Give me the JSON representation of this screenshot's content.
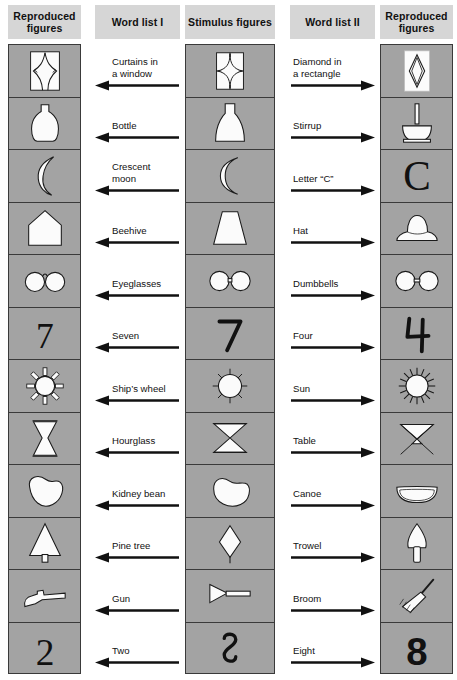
{
  "figure": {
    "columns": [
      {
        "id": "reproduced-left",
        "header": "Reproduced\nfigures",
        "kind": "figures"
      },
      {
        "id": "word-list-1",
        "header": "Word list I",
        "kind": "words",
        "arrow": "left"
      },
      {
        "id": "stimulus",
        "header": "Stimulus figures",
        "kind": "figures"
      },
      {
        "id": "word-list-2",
        "header": "Word list II",
        "kind": "words",
        "arrow": "right"
      },
      {
        "id": "reproduced-right",
        "header": "Reproduced\nfigures",
        "kind": "figures"
      }
    ],
    "header_labels": {
      "reproduced_left": "Reproduced\nfigures",
      "word_list_1": "Word list I",
      "stimulus": "Stimulus figures",
      "word_list_2": "Word list II",
      "reproduced_right": "Reproduced\nfigures"
    },
    "colors": {
      "header_band": "#d6d6d6",
      "cell_background": "#a3a3a3",
      "cell_border": "#3a3a3a",
      "figure_fill": "#fbfbfb",
      "ink": "#111111",
      "page": "#ffffff"
    },
    "row_count": 12,
    "rows": [
      {
        "index": 1,
        "stimulus": "four-pointed-star-in-square",
        "word_list_1": "Curtains in\na window",
        "word_list_2": "Diamond in\na rectangle",
        "reproduced_left": "curtains-in-window",
        "reproduced_right": "diamond-in-rectangle"
      },
      {
        "index": 2,
        "stimulus": "flask-shape",
        "word_list_1": "Bottle",
        "word_list_2": "Stirrup",
        "reproduced_left": "bottle",
        "reproduced_right": "stirrup"
      },
      {
        "index": 3,
        "stimulus": "crescent-shape",
        "word_list_1": "Crescent\nmoon",
        "word_list_2": "Letter “C”",
        "reproduced_left": "crescent-moon",
        "reproduced_right": "letter-c"
      },
      {
        "index": 4,
        "stimulus": "trapezoid",
        "word_list_1": "Beehive",
        "word_list_2": "Hat",
        "reproduced_left": "beehive",
        "reproduced_right": "hat"
      },
      {
        "index": 5,
        "stimulus": "two-circles-joined",
        "word_list_1": "Eyeglasses",
        "word_list_2": "Dumbbells",
        "reproduced_left": "eyeglasses",
        "reproduced_right": "dumbbells"
      },
      {
        "index": 6,
        "stimulus": "numeral-seven-four-ambiguous",
        "word_list_1": "Seven",
        "word_list_2": "Four",
        "reproduced_left": "numeral-7",
        "reproduced_right": "numeral-4"
      },
      {
        "index": 7,
        "stimulus": "circle-with-rays",
        "word_list_1": "Ship’s wheel",
        "word_list_2": "Sun",
        "reproduced_left": "ships-wheel",
        "reproduced_right": "sun"
      },
      {
        "index": 8,
        "stimulus": "hourglass-in-rectangle",
        "word_list_1": "Hourglass",
        "word_list_2": "Table",
        "reproduced_left": "hourglass",
        "reproduced_right": "table"
      },
      {
        "index": 9,
        "stimulus": "kidney-bean-shape",
        "word_list_1": "Kidney bean",
        "word_list_2": "Canoe",
        "reproduced_left": "kidney-bean",
        "reproduced_right": "canoe"
      },
      {
        "index": 10,
        "stimulus": "diamond-with-stem",
        "word_list_1": "Pine tree",
        "word_list_2": "Trowel",
        "reproduced_left": "pine-tree",
        "reproduced_right": "trowel"
      },
      {
        "index": 11,
        "stimulus": "triangle-with-bar",
        "word_list_1": "Gun",
        "word_list_2": "Broom",
        "reproduced_left": "gun",
        "reproduced_right": "broom"
      },
      {
        "index": 12,
        "stimulus": "numeral-two-eight-ambiguous",
        "word_list_1": "Two",
        "word_list_2": "Eight",
        "reproduced_left": "numeral-2",
        "reproduced_right": "numeral-8"
      }
    ]
  }
}
